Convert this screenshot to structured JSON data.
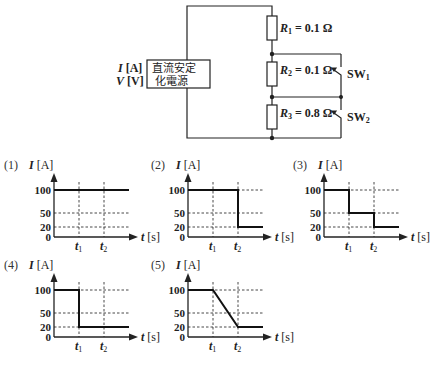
{
  "circuit": {
    "source_label_line1": "直流安定",
    "source_label_line2": "化電源",
    "current_label": "I",
    "current_unit": "[A]",
    "voltage_label": "V",
    "voltage_unit": "[V]",
    "resistors": [
      {
        "name": "R",
        "sub": "1",
        "value": "= 0.1 Ω"
      },
      {
        "name": "R",
        "sub": "2",
        "value": "= 0.1 Ω"
      },
      {
        "name": "R",
        "sub": "3",
        "value": "= 0.8 Ω"
      }
    ],
    "switches": [
      {
        "name": "SW",
        "sub": "1"
      },
      {
        "name": "SW",
        "sub": "2"
      }
    ]
  },
  "chart_data": [
    {
      "type": "line",
      "label": "(1)",
      "ylabel": "I [A]",
      "xlabel": "t [s]",
      "yticks": [
        "100",
        "50",
        "20",
        "0"
      ],
      "xticks": [
        "t1",
        "t2"
      ],
      "points": [
        [
          0,
          100
        ],
        [
          1,
          100
        ],
        [
          2,
          100
        ],
        [
          3,
          100
        ]
      ]
    },
    {
      "type": "line",
      "label": "(2)",
      "ylabel": "I [A]",
      "xlabel": "t [s]",
      "yticks": [
        "100",
        "50",
        "20",
        "0"
      ],
      "xticks": [
        "t1",
        "t2"
      ],
      "points": [
        [
          0,
          100
        ],
        [
          2,
          100
        ],
        [
          2,
          20
        ],
        [
          3,
          20
        ]
      ]
    },
    {
      "type": "line",
      "label": "(3)",
      "ylabel": "I [A]",
      "xlabel": "t [s]",
      "yticks": [
        "100",
        "50",
        "20",
        "0"
      ],
      "xticks": [
        "t1",
        "t2"
      ],
      "points": [
        [
          0,
          100
        ],
        [
          1,
          100
        ],
        [
          1,
          50
        ],
        [
          2,
          50
        ],
        [
          2,
          20
        ],
        [
          3,
          20
        ]
      ]
    },
    {
      "type": "line",
      "label": "(4)",
      "ylabel": "I [A]",
      "xlabel": "t [s]",
      "yticks": [
        "100",
        "50",
        "20",
        "0"
      ],
      "xticks": [
        "t1",
        "t2"
      ],
      "points": [
        [
          0,
          100
        ],
        [
          1,
          100
        ],
        [
          1,
          20
        ],
        [
          3,
          20
        ]
      ]
    },
    {
      "type": "line",
      "label": "(5)",
      "ylabel": "I [A]",
      "xlabel": "t [s]",
      "yticks": [
        "100",
        "50",
        "20",
        "0"
      ],
      "xticks": [
        "t1",
        "t2"
      ],
      "points": [
        [
          0,
          100
        ],
        [
          1,
          100
        ],
        [
          2,
          20
        ],
        [
          3,
          20
        ]
      ]
    }
  ],
  "graph_text": {
    "t_label": "t",
    "s_unit": "[s]",
    "i_label": "I",
    "a_unit": "[A]",
    "t1": "t",
    "t1_sub": "1",
    "t2": "t",
    "t2_sub": "2"
  }
}
